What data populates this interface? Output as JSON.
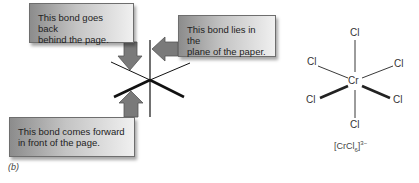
{
  "figure": {
    "part_label": "(b)",
    "callouts": [
      {
        "id": "back",
        "lines": [
          "This bond goes back",
          "behind the page."
        ]
      },
      {
        "id": "plane",
        "lines": [
          "This bond lies in the",
          "plane of the paper."
        ]
      },
      {
        "id": "forward",
        "lines": [
          "This bond comes forward",
          "in front of the page."
        ]
      }
    ],
    "molecule": {
      "center_atom": "Cr",
      "ligands": [
        "Cl",
        "Cl",
        "Cl",
        "Cl",
        "Cl",
        "Cl"
      ],
      "formula_prefix": "[CrCl",
      "formula_subscript": "6",
      "formula_suffix": "]",
      "formula_charge": "3−"
    }
  }
}
